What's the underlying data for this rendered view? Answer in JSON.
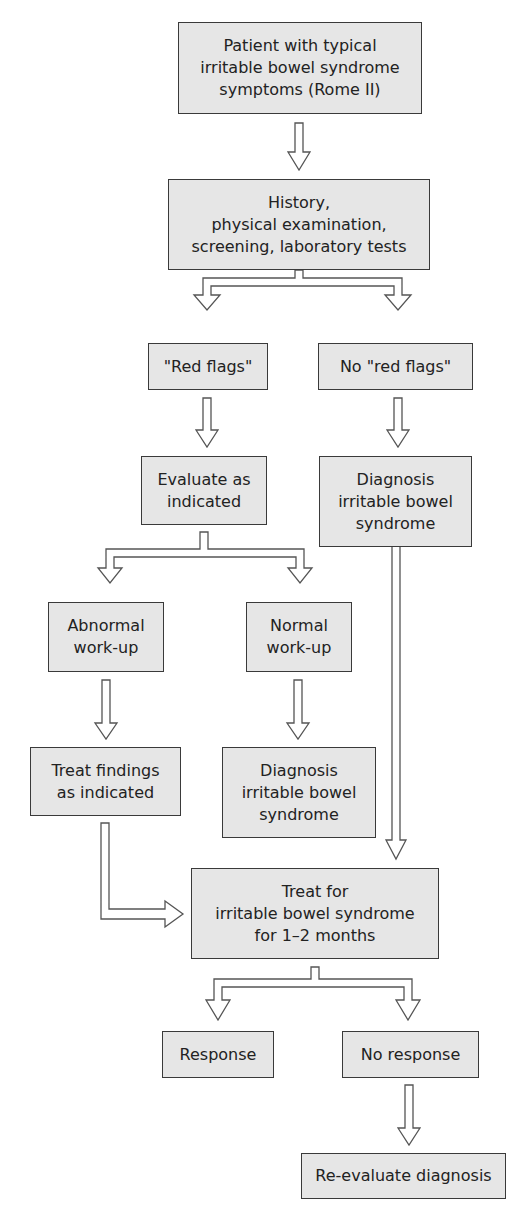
{
  "diagram": {
    "type": "flowchart",
    "nodes": [
      {
        "id": "start",
        "label": "Patient with typical\nirritable bowel syndrome\nsymptoms (Rome II)"
      },
      {
        "id": "history",
        "label": "History,\nphysical examination,\nscreening, laboratory tests"
      },
      {
        "id": "red_flags",
        "label": "\"Red flags\""
      },
      {
        "id": "no_red_flags",
        "label": "No \"red flags\""
      },
      {
        "id": "evaluate",
        "label": "Evaluate as\nindicated"
      },
      {
        "id": "diag_ibs_1",
        "label": "Diagnosis\nirritable bowel\nsyndrome"
      },
      {
        "id": "abnormal",
        "label": "Abnormal\nwork-up"
      },
      {
        "id": "normal",
        "label": "Normal\nwork-up"
      },
      {
        "id": "treat_findings",
        "label": "Treat findings\nas indicated"
      },
      {
        "id": "diag_ibs_2",
        "label": "Diagnosis\nirritable bowel\nsyndrome"
      },
      {
        "id": "treat_ibs",
        "label": "Treat for\nirritable bowel syndrome\nfor 1–2 months"
      },
      {
        "id": "response",
        "label": "Response"
      },
      {
        "id": "no_response",
        "label": "No response"
      },
      {
        "id": "reevaluate",
        "label": "Re-evaluate diagnosis"
      }
    ],
    "edges": [
      {
        "from": "start",
        "to": "history"
      },
      {
        "from": "history",
        "to": "red_flags"
      },
      {
        "from": "history",
        "to": "no_red_flags"
      },
      {
        "from": "red_flags",
        "to": "evaluate"
      },
      {
        "from": "no_red_flags",
        "to": "diag_ibs_1"
      },
      {
        "from": "evaluate",
        "to": "abnormal"
      },
      {
        "from": "evaluate",
        "to": "normal"
      },
      {
        "from": "abnormal",
        "to": "treat_findings"
      },
      {
        "from": "normal",
        "to": "diag_ibs_2"
      },
      {
        "from": "treat_findings",
        "to": "treat_ibs"
      },
      {
        "from": "diag_ibs_1",
        "to": "treat_ibs"
      },
      {
        "from": "treat_ibs",
        "to": "response"
      },
      {
        "from": "treat_ibs",
        "to": "no_response"
      },
      {
        "from": "no_response",
        "to": "reevaluate"
      }
    ],
    "colors": {
      "box_fill": "#e6e6e6",
      "box_border": "#3a3a3a",
      "arrow_fill": "#ffffff",
      "arrow_stroke": "#555555"
    }
  }
}
